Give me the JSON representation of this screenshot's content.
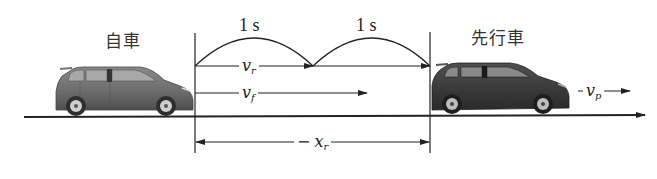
{
  "diagram": {
    "labels": {
      "own_vehicle": "自車",
      "preceding_vehicle": "先行車"
    },
    "intervals": [
      {
        "label": "1 s"
      },
      {
        "label": "1 s"
      }
    ],
    "vectors": {
      "v_r": {
        "symbol": "v",
        "subscript": "r"
      },
      "v_f": {
        "symbol": "v",
        "subscript": "f"
      },
      "v_p": {
        "symbol": "v",
        "subscript": "p"
      },
      "x_r": {
        "prefix": "−",
        "symbol": "x",
        "subscript": "r"
      }
    },
    "colors": {
      "line": "#222222",
      "own_car": "#6b6b6b",
      "preceding_car": "#3a3a3a",
      "window": "#9a9a9a",
      "text": "#222222"
    }
  }
}
